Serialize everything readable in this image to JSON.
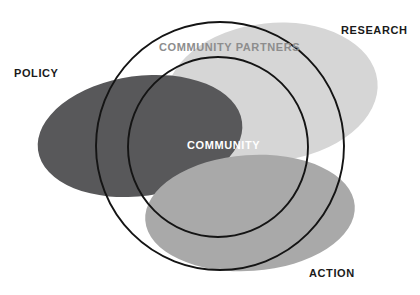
{
  "figure": {
    "type": "venn-diagram",
    "background_color": "#ffffff",
    "outline_color": "#141414"
  },
  "ellipses": [
    {
      "key": "policy",
      "label": "POLICY",
      "fill": "#58585a",
      "cx": 140,
      "cy": 136,
      "rx": 103,
      "ry": 60,
      "rotation": -8
    },
    {
      "key": "research",
      "label": "RESEARCH",
      "fill": "#d6d6d6",
      "cx": 272,
      "cy": 92,
      "rx": 106,
      "ry": 69,
      "rotation": -6
    },
    {
      "key": "action",
      "label": "ACTION",
      "fill": "#a9a9a9",
      "cx": 250,
      "cy": 213,
      "rx": 105,
      "ry": 58,
      "rotation": -4
    }
  ],
  "circles": [
    {
      "key": "outer",
      "label": "COMMUNITY PARTNERS",
      "cx": 220,
      "cy": 146,
      "r": 124,
      "stroke": "#141414",
      "stroke_width": 1.9,
      "label_color": "#8d8d8d"
    },
    {
      "key": "inner",
      "label": "COMMUNITY",
      "cx": 218,
      "cy": 147,
      "r": 90,
      "stroke": "#141414",
      "stroke_width": 1.9,
      "label_color": "#ffffff"
    }
  ],
  "labels": {
    "policy": "POLICY",
    "research": "RESEARCH",
    "action": "ACTION",
    "community_partners": "COMMUNITY PARTNERS",
    "community": "COMMUNITY"
  }
}
